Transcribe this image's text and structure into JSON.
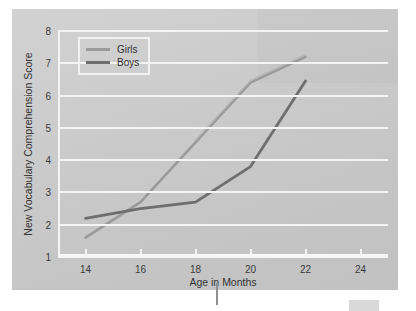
{
  "chart_data": {
    "type": "line",
    "title": "",
    "xlabel": "Age in Months",
    "ylabel": "New Vocabulary Comprehension Score",
    "x": [
      14,
      16,
      18,
      20,
      22
    ],
    "xlim": [
      13,
      25
    ],
    "ylim": [
      1,
      8
    ],
    "xticks": [
      14,
      16,
      18,
      20,
      22,
      24
    ],
    "yticks": [
      1,
      2,
      3,
      4,
      5,
      6,
      7,
      8
    ],
    "grid": "horizontal",
    "legend_position": "top-left",
    "series": [
      {
        "name": "Girls",
        "color": "#9a9a9a",
        "values": [
          1.6,
          2.7,
          4.55,
          6.4,
          7.2
        ]
      },
      {
        "name": "Boys",
        "color": "#6e6e6e",
        "values": [
          2.2,
          2.5,
          2.7,
          3.8,
          6.45
        ]
      }
    ]
  },
  "legend": {
    "entries": [
      {
        "label": "Girls"
      },
      {
        "label": "Boys"
      }
    ]
  },
  "colors": {
    "panel_background": "#cdcdcd",
    "page_background": "#ffffff",
    "gridline": "#f4f4f4",
    "girls_line": "#9a9a9a",
    "boys_line": "#6e6e6e",
    "tick_text": "#3a3a3a"
  }
}
